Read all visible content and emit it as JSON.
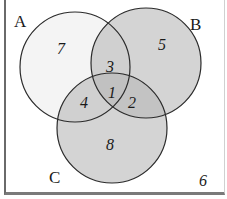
{
  "diagram": {
    "type": "venn",
    "sets": [
      {
        "name": "A",
        "cx": 75,
        "cy": 67,
        "r": 55,
        "fill": "#f4f4f4",
        "fill_opacity": 1.0
      },
      {
        "name": "B",
        "cx": 146,
        "cy": 63,
        "r": 55,
        "fill": "#b8b8b8",
        "fill_opacity": 0.6
      },
      {
        "name": "C",
        "cx": 112,
        "cy": 128,
        "r": 55,
        "fill": "#b8b8b8",
        "fill_opacity": 0.6
      }
    ],
    "labels": {
      "A": "A",
      "B": "B",
      "C": "C"
    },
    "regions": {
      "A_only": "7",
      "B_only": "5",
      "C_only": "8",
      "A_and_B_only": "3",
      "A_and_C_only": "4",
      "B_and_C_only": "2",
      "A_and_B_and_C": "1",
      "outside": "6"
    },
    "stroke_color": "#2a2a2a"
  }
}
